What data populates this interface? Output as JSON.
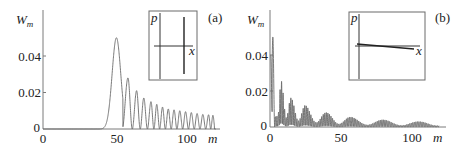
{
  "chart_data": [
    {
      "type": "line",
      "panel_label": "(a)",
      "title": "",
      "xlabel": "m",
      "ylabel": "W_m",
      "ylabel_main": "W",
      "ylabel_sub": "m",
      "xlim": [
        0,
        120
      ],
      "ylim": [
        0,
        0.055
      ],
      "xticks": [
        0,
        50,
        100
      ],
      "xtick_labels": [
        "0",
        "50",
        "100"
      ],
      "yticks": [
        0,
        0.02,
        0.04
      ],
      "ytick_labels": [
        "0",
        "0.02",
        "0.04"
      ],
      "grid": false,
      "legend": null,
      "series": [
        {
          "name": "W_m distribution (a)",
          "description": "Zero until m≈42, main peak at m≈51 (≈0.050), then oscillating peaks decaying slowly; minima reach zero",
          "peaks": [
            {
              "m": 51,
              "W": 0.05
            },
            {
              "m": 59,
              "W": 0.028
            },
            {
              "m": 65,
              "W": 0.021
            },
            {
              "m": 70,
              "W": 0.017
            },
            {
              "m": 75,
              "W": 0.015
            },
            {
              "m": 79,
              "W": 0.0135
            },
            {
              "m": 83,
              "W": 0.012
            },
            {
              "m": 87,
              "W": 0.011
            },
            {
              "m": 91,
              "W": 0.0105
            },
            {
              "m": 95,
              "W": 0.01
            },
            {
              "m": 99,
              "W": 0.0095
            },
            {
              "m": 103,
              "W": 0.009
            },
            {
              "m": 107,
              "W": 0.0085
            },
            {
              "m": 111,
              "W": 0.008
            },
            {
              "m": 115,
              "W": 0.0078
            },
            {
              "m": 118,
              "W": 0.0075
            }
          ]
        }
      ],
      "inset": {
        "xlabel": "x",
        "ylabel": "p",
        "description": "Phase-space sketch: p axis (vertical), x axis (horizontal), and a vertical line segment to the right of the p axis"
      }
    },
    {
      "type": "line",
      "panel_label": "(b)",
      "title": "",
      "xlabel": "m",
      "ylabel": "W_m",
      "ylabel_main": "W",
      "ylabel_sub": "m",
      "xlim": [
        0,
        120
      ],
      "ylim": [
        0,
        0.055
      ],
      "xticks": [
        0,
        50,
        100
      ],
      "xtick_labels": [
        "0",
        "50",
        "100"
      ],
      "yticks": [
        0,
        0.02,
        0.04
      ],
      "ytick_labels": [
        "0",
        "0.02",
        "0.04"
      ],
      "grid": false,
      "legend": null,
      "series": [
        {
          "name": "W_m distribution (b)",
          "description": "Maximum near m≈2 (≈0.050), then rapid oscillations inside decaying beat envelopes (wave packets near m≈8, 15, 25, 40, 57, 80, 105)",
          "peaks": [
            {
              "m": 1,
              "W": 0.04
            },
            {
              "m": 2,
              "W": 0.05
            },
            {
              "m": 4,
              "W": 0.023
            },
            {
              "m": 7,
              "W": 0.027
            },
            {
              "m": 15,
              "W": 0.016
            },
            {
              "m": 25,
              "W": 0.012
            },
            {
              "m": 40,
              "W": 0.008
            },
            {
              "m": 57,
              "W": 0.0055
            },
            {
              "m": 80,
              "W": 0.004
            },
            {
              "m": 105,
              "W": 0.003
            }
          ]
        }
      ],
      "inset": {
        "xlabel": "x",
        "ylabel": "p",
        "description": "Phase-space sketch: p axis (vertical), x axis (horizontal), and a nearly horizontal slightly descending line segment along the x axis"
      }
    }
  ]
}
